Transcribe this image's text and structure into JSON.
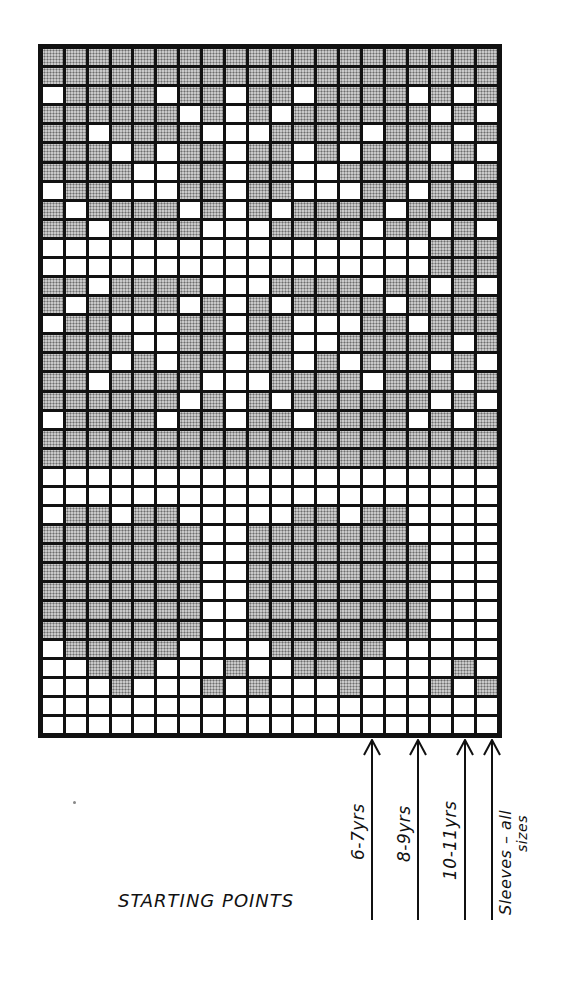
{
  "grid": {
    "columns": 20,
    "rows": 36,
    "legend": {
      "shaded": "contrast colour (stippled)",
      "white": "main colour"
    },
    "colors": {
      "shaded": "#c9c9c9",
      "white": "#ffffff",
      "lines": "#111111"
    },
    "pattern": [
      "11111111111111111111",
      "11111111111111111111",
      "01111011011011110101",
      "11111101010111111010",
      "11011110001111011101",
      "11101011011010111010",
      "11110011011001111101",
      "01100011011000110111",
      "10111101010111101111",
      "11011110001111011010",
      "00000000000000000111",
      "00000000000000000111",
      "11011110001111011010",
      "10111101010111101111",
      "01100011011000110111",
      "11110011011001111101",
      "11101011011010111010",
      "11011110001111011101",
      "11111101010111111010",
      "01111011011011110101",
      "11111111111111111111",
      "11111111111111111111",
      "00000000000000000000",
      "00000000000000000000",
      "01101100000110110000",
      "11111110011111110000",
      "11111110011111111000",
      "11111110011111111000",
      "11111110011111111000",
      "11111110011111111000",
      "11111110011111111000",
      "01111100001111100000",
      "00111000100111000010",
      "00010001010001000101",
      "00000000000000000000",
      "00000000000000000000"
    ]
  },
  "starting_points": {
    "caption": "STARTING POINTS",
    "markers": [
      {
        "label": "6-7yrs",
        "x": 372
      },
      {
        "label": "8-9yrs",
        "x": 418
      },
      {
        "label": "10-11yrs",
        "x": 464
      },
      {
        "label": "Sleeves – all",
        "label2": "sizes",
        "x": 490
      }
    ]
  }
}
